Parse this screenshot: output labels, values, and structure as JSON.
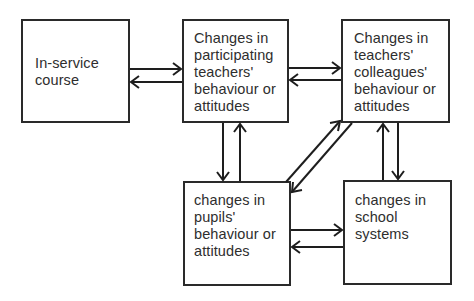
{
  "diagram": {
    "boxes": [
      {
        "id": "in-service",
        "label": "In-service\ncourse"
      },
      {
        "id": "participating-teachers",
        "label": "Changes in\nparticipating\nteachers'\nbehaviour or\nattitudes"
      },
      {
        "id": "colleagues",
        "label": "Changes in\nteachers'\ncolleagues'\nbehaviour or\nattitudes"
      },
      {
        "id": "pupils",
        "label": "changes in\npupils'\nbehaviour or\nattitudes"
      },
      {
        "id": "school-systems",
        "label": "changes in\nschool\nsystems"
      }
    ],
    "connections": [
      {
        "from": "in-service",
        "to": "participating-teachers",
        "bidirectional": true
      },
      {
        "from": "participating-teachers",
        "to": "colleagues",
        "bidirectional": true
      },
      {
        "from": "participating-teachers",
        "to": "pupils",
        "bidirectional": true
      },
      {
        "from": "colleagues",
        "to": "pupils",
        "bidirectional": true
      },
      {
        "from": "colleagues",
        "to": "school-systems",
        "bidirectional": true
      },
      {
        "from": "pupils",
        "to": "school-systems",
        "bidirectional": true
      }
    ],
    "colors": {
      "line": "#1e1e1e",
      "text": "#2e2e2e",
      "background": "#ffffff"
    }
  }
}
